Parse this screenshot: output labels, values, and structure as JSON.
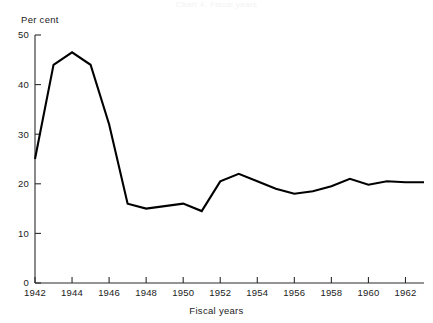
{
  "figure": {
    "faint_top_caption": "Chart 4.  Fiscal years",
    "y_unit_label": "Per cent",
    "x_axis_title": "Fiscal years"
  },
  "chart_data": {
    "type": "line",
    "title": "",
    "subtitle": "",
    "xlabel": "Fiscal years",
    "ylabel": "Per cent",
    "ylim": [
      0,
      50
    ],
    "xlim": [
      1942,
      1963
    ],
    "grid": false,
    "legend": false,
    "legend_position": "none",
    "y_ticks": [
      0,
      10,
      20,
      30,
      40,
      50
    ],
    "y_tick_labels": [
      "0",
      "10",
      "20",
      "30",
      "40",
      "50"
    ],
    "x_ticks": [
      1942,
      1944,
      1946,
      1948,
      1950,
      1952,
      1954,
      1956,
      1958,
      1960,
      1962
    ],
    "x_tick_labels": [
      "1942",
      "1944",
      "1946",
      "1948",
      "1950",
      "1952",
      "1954",
      "1956",
      "1958",
      "1960",
      "1962"
    ],
    "x_minor_ticks": [
      1943,
      1945,
      1947,
      1949,
      1951,
      1953,
      1955,
      1957,
      1959,
      1961,
      1963
    ],
    "x": [
      1942,
      1943,
      1944,
      1945,
      1946,
      1947,
      1948,
      1949,
      1950,
      1951,
      1952,
      1953,
      1954,
      1955,
      1956,
      1957,
      1958,
      1959,
      1960,
      1961,
      1962,
      1963
    ],
    "values": [
      25.0,
      44.0,
      46.5,
      44.0,
      32.0,
      16.0,
      15.0,
      15.5,
      16.0,
      14.5,
      20.5,
      22.0,
      20.5,
      19.0,
      18.0,
      18.5,
      19.5,
      21.0,
      19.8,
      20.5,
      20.3,
      20.3
    ],
    "series": [
      {
        "name": "Per cent",
        "color": "#000000",
        "values": [
          25.0,
          44.0,
          46.5,
          44.0,
          32.0,
          16.0,
          15.0,
          15.5,
          16.0,
          14.5,
          20.5,
          22.0,
          20.5,
          19.0,
          18.0,
          18.5,
          19.5,
          21.0,
          19.8,
          20.5,
          20.3,
          20.3
        ]
      }
    ]
  },
  "colors": {
    "line": "#000000",
    "axis": "#2b2b2b",
    "text": "#222222",
    "background": "#ffffff"
  }
}
